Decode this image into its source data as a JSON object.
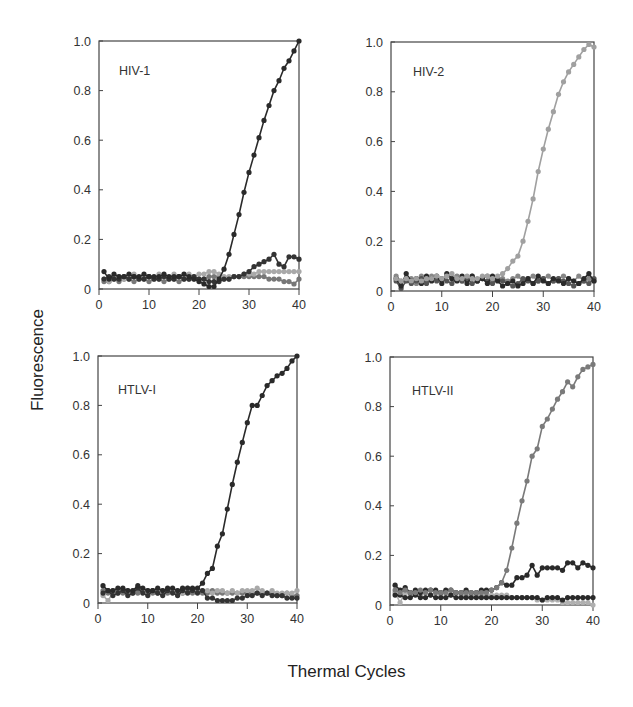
{
  "figure": {
    "ylabel": "Fluorescence",
    "xlabel": "Thermal Cycles"
  },
  "chart_data": [
    {
      "type": "line",
      "title": "HIV-1",
      "xlabel": "Thermal Cycles",
      "ylabel": "Fluorescence",
      "xlim": [
        0,
        40
      ],
      "ylim": [
        0,
        1.0
      ],
      "xticks": [
        0,
        10,
        20,
        30,
        40
      ],
      "yticks": [
        0,
        0.2,
        0.4,
        0.6,
        0.8,
        1.0
      ],
      "ytick_labels": [
        "0",
        "0.2",
        "0.4",
        "0.6",
        "0.8",
        "1.0"
      ],
      "grid": false,
      "x": [
        1,
        2,
        3,
        4,
        5,
        6,
        7,
        8,
        9,
        10,
        11,
        12,
        13,
        14,
        15,
        16,
        17,
        18,
        19,
        20,
        21,
        22,
        23,
        24,
        25,
        26,
        27,
        28,
        29,
        30,
        31,
        32,
        33,
        34,
        35,
        36,
        37,
        38,
        39,
        40
      ],
      "series": [
        {
          "name": "HIV-1 target",
          "color": "#2a2a2a",
          "values": [
            0.07,
            0.04,
            0.06,
            0.05,
            0.05,
            0.06,
            0.05,
            0.05,
            0.06,
            0.05,
            0.05,
            0.05,
            0.06,
            0.05,
            0.05,
            0.05,
            0.06,
            0.05,
            0.04,
            0.03,
            0.02,
            0.01,
            0.01,
            0.04,
            0.08,
            0.14,
            0.22,
            0.3,
            0.39,
            0.47,
            0.54,
            0.61,
            0.68,
            0.74,
            0.8,
            0.84,
            0.89,
            0.92,
            0.96,
            1.0
          ]
        },
        {
          "name": "Control A",
          "color": "#333333",
          "values": [
            0.04,
            0.05,
            0.04,
            0.04,
            0.05,
            0.04,
            0.05,
            0.04,
            0.04,
            0.05,
            0.04,
            0.04,
            0.05,
            0.04,
            0.04,
            0.05,
            0.04,
            0.04,
            0.05,
            0.04,
            0.04,
            0.03,
            0.03,
            0.03,
            0.04,
            0.04,
            0.05,
            0.05,
            0.06,
            0.07,
            0.09,
            0.1,
            0.11,
            0.12,
            0.14,
            0.1,
            0.09,
            0.13,
            0.13,
            0.12
          ]
        },
        {
          "name": "Control B",
          "color": "#a9a9a9",
          "values": [
            0.04,
            0.03,
            0.05,
            0.05,
            0.04,
            0.05,
            0.06,
            0.04,
            0.05,
            0.05,
            0.04,
            0.06,
            0.05,
            0.04,
            0.06,
            0.05,
            0.05,
            0.06,
            0.05,
            0.06,
            0.06,
            0.07,
            0.07,
            0.06,
            0.05,
            0.05,
            0.05,
            0.05,
            0.06,
            0.06,
            0.06,
            0.07,
            0.07,
            0.07,
            0.07,
            0.07,
            0.07,
            0.07,
            0.07,
            0.07
          ]
        },
        {
          "name": "Control C",
          "color": "#777777",
          "values": [
            0.03,
            0.03,
            0.04,
            0.03,
            0.04,
            0.04,
            0.03,
            0.04,
            0.04,
            0.03,
            0.04,
            0.04,
            0.03,
            0.04,
            0.04,
            0.03,
            0.04,
            0.04,
            0.04,
            0.04,
            0.04,
            0.05,
            0.05,
            0.05,
            0.04,
            0.04,
            0.05,
            0.05,
            0.05,
            0.05,
            0.05,
            0.05,
            0.05,
            0.04,
            0.04,
            0.04,
            0.03,
            0.03,
            0.02,
            0.04
          ]
        }
      ]
    },
    {
      "type": "line",
      "title": "HIV-2",
      "xlabel": "Thermal Cycles",
      "ylabel": "Fluorescence",
      "xlim": [
        0,
        40
      ],
      "ylim": [
        0,
        1.0
      ],
      "xticks": [
        0,
        10,
        20,
        30,
        40
      ],
      "yticks": [
        0,
        0.2,
        0.4,
        0.6,
        0.8,
        1.0
      ],
      "ytick_labels": [
        "0",
        "0.2",
        "0.4",
        "0.6",
        "0.8",
        "1.0"
      ],
      "grid": false,
      "x": [
        1,
        2,
        3,
        4,
        5,
        6,
        7,
        8,
        9,
        10,
        11,
        12,
        13,
        14,
        15,
        16,
        17,
        18,
        19,
        20,
        21,
        22,
        23,
        24,
        25,
        26,
        27,
        28,
        29,
        30,
        31,
        32,
        33,
        34,
        35,
        36,
        37,
        38,
        39,
        40
      ],
      "series": [
        {
          "name": "HIV-2 target",
          "color": "#a0a0a0",
          "values": [
            0.05,
            0.04,
            0.05,
            0.04,
            0.05,
            0.04,
            0.05,
            0.05,
            0.06,
            0.05,
            0.06,
            0.07,
            0.05,
            0.05,
            0.06,
            0.05,
            0.05,
            0.06,
            0.06,
            0.05,
            0.06,
            0.07,
            0.09,
            0.12,
            0.14,
            0.2,
            0.28,
            0.37,
            0.48,
            0.57,
            0.65,
            0.72,
            0.79,
            0.84,
            0.88,
            0.91,
            0.94,
            0.97,
            0.99,
            0.98
          ]
        },
        {
          "name": "Control A",
          "color": "#2a2a2a",
          "values": [
            0.05,
            0.02,
            0.07,
            0.04,
            0.05,
            0.03,
            0.06,
            0.04,
            0.06,
            0.03,
            0.07,
            0.05,
            0.04,
            0.06,
            0.03,
            0.06,
            0.04,
            0.05,
            0.03,
            0.06,
            0.04,
            0.02,
            0.03,
            0.04,
            0.02,
            0.03,
            0.05,
            0.03,
            0.06,
            0.04,
            0.03,
            0.05,
            0.04,
            0.03,
            0.05,
            0.04,
            0.03,
            0.05,
            0.07,
            0.04
          ]
        },
        {
          "name": "Control B",
          "color": "#555555",
          "values": [
            0.04,
            0.01,
            0.04,
            0.03,
            0.04,
            0.05,
            0.03,
            0.05,
            0.04,
            0.05,
            0.04,
            0.03,
            0.05,
            0.04,
            0.05,
            0.03,
            0.04,
            0.05,
            0.04,
            0.03,
            0.05,
            0.04,
            0.03,
            0.02,
            0.03,
            0.05,
            0.04,
            0.03,
            0.04,
            0.05,
            0.03,
            0.04,
            0.05,
            0.04,
            0.03,
            0.02,
            0.03,
            0.04,
            0.03,
            0.05
          ]
        },
        {
          "name": "Control C",
          "color": "#888888",
          "values": [
            0.06,
            0.04,
            0.05,
            0.05,
            0.03,
            0.06,
            0.04,
            0.06,
            0.05,
            0.04,
            0.06,
            0.05,
            0.06,
            0.04,
            0.05,
            0.06,
            0.04,
            0.05,
            0.06,
            0.04,
            0.05,
            0.05,
            0.04,
            0.05,
            0.06,
            0.04,
            0.05,
            0.06,
            0.04,
            0.05,
            0.06,
            0.04,
            0.05,
            0.06,
            0.05,
            0.04,
            0.06,
            0.04,
            0.05,
            0.04
          ]
        }
      ]
    },
    {
      "type": "line",
      "title": "HTLV-I",
      "xlabel": "Thermal Cycles",
      "ylabel": "Fluorescence",
      "xlim": [
        0,
        40
      ],
      "ylim": [
        0,
        1.0
      ],
      "xticks": [
        0,
        10,
        20,
        30,
        40
      ],
      "yticks": [
        0,
        0.2,
        0.4,
        0.6,
        0.8,
        1.0
      ],
      "ytick_labels": [
        "0",
        "0.2",
        "0.4",
        "0.6",
        "0.8",
        "1.0"
      ],
      "grid": false,
      "x": [
        1,
        2,
        3,
        4,
        5,
        6,
        7,
        8,
        9,
        10,
        11,
        12,
        13,
        14,
        15,
        16,
        17,
        18,
        19,
        20,
        21,
        22,
        23,
        24,
        25,
        26,
        27,
        28,
        29,
        30,
        31,
        32,
        33,
        34,
        35,
        36,
        37,
        38,
        39,
        40
      ],
      "series": [
        {
          "name": "HTLV-I target",
          "color": "#2a2a2a",
          "values": [
            0.07,
            0.05,
            0.05,
            0.06,
            0.06,
            0.05,
            0.05,
            0.07,
            0.06,
            0.05,
            0.05,
            0.06,
            0.05,
            0.06,
            0.06,
            0.05,
            0.06,
            0.06,
            0.06,
            0.06,
            0.08,
            0.12,
            0.14,
            0.23,
            0.28,
            0.38,
            0.48,
            0.57,
            0.65,
            0.73,
            0.8,
            0.8,
            0.84,
            0.88,
            0.9,
            0.92,
            0.93,
            0.95,
            0.98,
            1.0
          ]
        },
        {
          "name": "Control A",
          "color": "#333333",
          "values": [
            0.04,
            0.05,
            0.03,
            0.04,
            0.05,
            0.03,
            0.04,
            0.06,
            0.04,
            0.03,
            0.05,
            0.04,
            0.03,
            0.05,
            0.04,
            0.03,
            0.05,
            0.04,
            0.05,
            0.04,
            0.05,
            0.02,
            0.02,
            0.01,
            0.01,
            0.01,
            0.01,
            0.02,
            0.02,
            0.03,
            0.03,
            0.04,
            0.03,
            0.04,
            0.03,
            0.03,
            0.03,
            0.02,
            0.02,
            0.02
          ]
        },
        {
          "name": "Control B",
          "color": "#a9a9a9",
          "values": [
            0.03,
            0.01,
            0.04,
            0.05,
            0.05,
            0.04,
            0.05,
            0.06,
            0.05,
            0.04,
            0.05,
            0.05,
            0.04,
            0.05,
            0.05,
            0.05,
            0.04,
            0.06,
            0.05,
            0.05,
            0.05,
            0.05,
            0.04,
            0.05,
            0.05,
            0.04,
            0.05,
            0.04,
            0.05,
            0.05,
            0.05,
            0.06,
            0.05,
            0.04,
            0.05,
            0.04,
            0.04,
            0.04,
            0.04,
            0.05
          ]
        },
        {
          "name": "Control C",
          "color": "#777777",
          "values": [
            0.05,
            0.04,
            0.05,
            0.04,
            0.04,
            0.05,
            0.04,
            0.04,
            0.05,
            0.05,
            0.04,
            0.04,
            0.05,
            0.04,
            0.05,
            0.04,
            0.04,
            0.05,
            0.04,
            0.05,
            0.04,
            0.04,
            0.05,
            0.04,
            0.04,
            0.04,
            0.04,
            0.04,
            0.04,
            0.04,
            0.04,
            0.04,
            0.04,
            0.04,
            0.04,
            0.03,
            0.03,
            0.04,
            0.03,
            0.03
          ]
        }
      ]
    },
    {
      "type": "line",
      "title": "HTLV-II",
      "xlabel": "Thermal Cycles",
      "ylabel": "Fluorescence",
      "xlim": [
        0,
        40
      ],
      "ylim": [
        0,
        1.0
      ],
      "xticks": [
        0,
        10,
        20,
        30,
        40
      ],
      "yticks": [
        0,
        0.2,
        0.4,
        0.6,
        0.8,
        1.0
      ],
      "ytick_labels": [
        "0",
        "0.2",
        "0.4",
        "0.6",
        "0.8",
        "1.0"
      ],
      "grid": false,
      "x": [
        1,
        2,
        3,
        4,
        5,
        6,
        7,
        8,
        9,
        10,
        11,
        12,
        13,
        14,
        15,
        16,
        17,
        18,
        19,
        20,
        21,
        22,
        23,
        24,
        25,
        26,
        27,
        28,
        29,
        30,
        31,
        32,
        33,
        34,
        35,
        36,
        37,
        38,
        39,
        40
      ],
      "series": [
        {
          "name": "HTLV-II target",
          "color": "#7a7a7a",
          "values": [
            0.06,
            0.05,
            0.06,
            0.05,
            0.05,
            0.06,
            0.05,
            0.06,
            0.05,
            0.05,
            0.05,
            0.06,
            0.05,
            0.05,
            0.05,
            0.05,
            0.05,
            0.05,
            0.05,
            0.06,
            0.07,
            0.09,
            0.14,
            0.23,
            0.33,
            0.42,
            0.5,
            0.6,
            0.63,
            0.72,
            0.75,
            0.79,
            0.83,
            0.86,
            0.9,
            0.88,
            0.92,
            0.95,
            0.96,
            0.97
          ]
        },
        {
          "name": "Control A",
          "color": "#2a2a2a",
          "values": [
            0.08,
            0.06,
            0.07,
            0.05,
            0.06,
            0.05,
            0.06,
            0.06,
            0.06,
            0.05,
            0.06,
            0.06,
            0.05,
            0.05,
            0.06,
            0.05,
            0.05,
            0.06,
            0.06,
            0.06,
            0.07,
            0.09,
            0.08,
            0.08,
            0.11,
            0.11,
            0.12,
            0.16,
            0.12,
            0.15,
            0.15,
            0.15,
            0.15,
            0.14,
            0.17,
            0.17,
            0.15,
            0.17,
            0.16,
            0.15
          ]
        },
        {
          "name": "Control B",
          "color": "#2a2a2a",
          "values": [
            0.04,
            0.04,
            0.03,
            0.03,
            0.04,
            0.03,
            0.03,
            0.04,
            0.03,
            0.03,
            0.03,
            0.04,
            0.03,
            0.03,
            0.03,
            0.03,
            0.03,
            0.03,
            0.03,
            0.03,
            0.03,
            0.03,
            0.03,
            0.03,
            0.03,
            0.03,
            0.03,
            0.03,
            0.03,
            0.02,
            0.03,
            0.03,
            0.03,
            0.02,
            0.03,
            0.03,
            0.03,
            0.03,
            0.03,
            0.03
          ]
        },
        {
          "name": "Control C",
          "color": "#b0b0b0",
          "values": [
            0.05,
            0.01,
            0.05,
            0.04,
            0.05,
            0.04,
            0.05,
            0.04,
            0.05,
            0.04,
            0.05,
            0.04,
            0.05,
            0.04,
            0.04,
            0.04,
            0.04,
            0.04,
            0.04,
            0.04,
            0.04,
            0.04,
            0.04,
            0.03,
            0.03,
            0.03,
            0.03,
            0.03,
            0.02,
            0.02,
            0.02,
            0.02,
            0.02,
            0.01,
            0.01,
            0.01,
            0.01,
            0.01,
            0.01,
            0.0
          ]
        }
      ]
    }
  ],
  "layout": {
    "panels": [
      {
        "left": 99,
        "top": 41,
        "right": 299,
        "bottom": 289,
        "title_x": 20,
        "title_y": 34
      },
      {
        "left": 391,
        "top": 42,
        "right": 594,
        "bottom": 291,
        "title_x": 22,
        "title_y": 34
      },
      {
        "left": 98,
        "top": 356,
        "right": 297,
        "bottom": 603,
        "title_x": 20,
        "title_y": 38
      },
      {
        "left": 390,
        "top": 357,
        "right": 593,
        "bottom": 605,
        "title_x": 22,
        "title_y": 38
      }
    ]
  }
}
